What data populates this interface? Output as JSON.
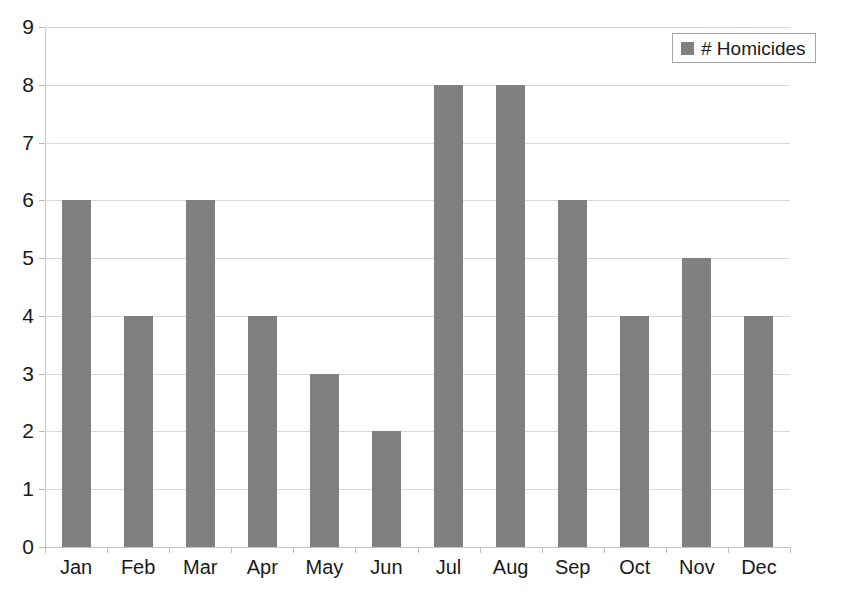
{
  "chart_data": {
    "type": "bar",
    "title": "",
    "xlabel": "",
    "ylabel": "",
    "categories": [
      "Jan",
      "Feb",
      "Mar",
      "Apr",
      "May",
      "Jun",
      "Jul",
      "Aug",
      "Sep",
      "Oct",
      "Nov",
      "Dec"
    ],
    "values": [
      6,
      4,
      6,
      4,
      3,
      2,
      8,
      8,
      6,
      4,
      5,
      4
    ],
    "series": [
      {
        "name": "# Homicides",
        "values": [
          6,
          4,
          6,
          4,
          3,
          2,
          8,
          8,
          6,
          4,
          5,
          4
        ]
      }
    ],
    "ylim": [
      0,
      9
    ],
    "ytick_labels": [
      "9",
      "8",
      "7",
      "6",
      "5",
      "4",
      "3",
      "2",
      "1",
      "0"
    ],
    "ytick_values": [
      9,
      8,
      7,
      6,
      5,
      4,
      3,
      2,
      1,
      0
    ],
    "grid": true,
    "grid_axis": "y",
    "legend_position": "top-right",
    "bar_color": "#808080",
    "grid_color": "#d9d9d9",
    "axis_color": "#b5b5b5",
    "text_color": "#1a1a1a",
    "background": "#ffffff"
  },
  "legend": {
    "label": "# Homicides",
    "marker": "square-marker",
    "marker_color": "#808080"
  }
}
